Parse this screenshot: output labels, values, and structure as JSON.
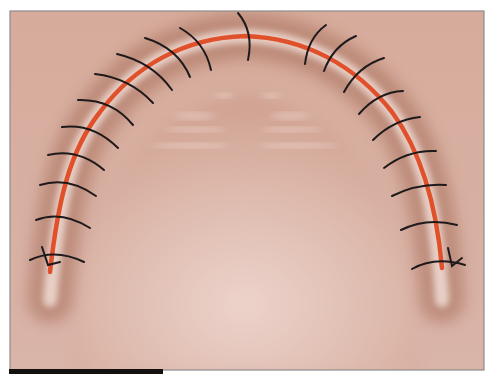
{
  "figure": {
    "colors": {
      "background": "#ffffff",
      "palate_light": "#e6c7bd",
      "palate_mid": "#d9afa1",
      "ridge_shadow": "#a86a55",
      "ridge_highlight": "#f1ddd6",
      "incision": "#e0502a",
      "suture": "#1e1a1c",
      "frame_border": "#8f8a8c",
      "bottom_bar": "#141010"
    },
    "frame": {
      "x": 10,
      "y": 11,
      "width": 474,
      "height": 359
    },
    "bottom_bar": {
      "x": 9,
      "y": 369,
      "width": 154,
      "height": 5
    },
    "incision_path": "M 50 272 C 58 200, 70 150, 100 112 C 135 65, 185 38, 245 36 C 305 38, 355 65, 392 112 C 420 150, 436 200, 442 268",
    "ridge_path": "M 50 300 C 58 200, 70 150, 100 112 C 135 65, 185 38, 245 36 C 305 38, 355 65, 392 112 C 420 150, 436 200, 442 300",
    "sutures": [
      {
        "d": "M 30 260 Q 55 248 84 262",
        "knot": true
      },
      {
        "d": "M 36 220 Q 62 210 90 228"
      },
      {
        "d": "M 40 185 Q 68 176 96 196"
      },
      {
        "d": "M 48 155 Q 78 148 104 170"
      },
      {
        "d": "M 62 127 Q 93 123 118 148"
      },
      {
        "d": "M 78 100 Q 112 99 133 125"
      },
      {
        "d": "M 95 74 Q 130 78 153 103"
      },
      {
        "d": "M 117 54 Q 152 62 172 90"
      },
      {
        "d": "M 145 38 Q 178 48 190 77"
      },
      {
        "d": "M 180 28 Q 205 42 211 70"
      },
      {
        "d": "M 238 13 Q 254 32 248 60"
      },
      {
        "d": "M 305 64 Q 308 38 326 25"
      },
      {
        "d": "M 324 71 Q 333 46 356 36"
      },
      {
        "d": "M 344 92 Q 358 66 384 58"
      },
      {
        "d": "M 359 114 Q 378 92 403 91"
      },
      {
        "d": "M 373 140 Q 393 120 420 117"
      },
      {
        "d": "M 384 168 Q 407 150 436 151"
      },
      {
        "d": "M 392 196 Q 418 183 446 185"
      },
      {
        "d": "M 401 230 Q 427 217 457 225"
      },
      {
        "d": "M 412 269 Q 435 256 465 265",
        "knot": true
      }
    ],
    "knots": [
      {
        "d": "M 42 247 L 48 265 L 60 262"
      },
      {
        "d": "M 448 248 L 452 266 L 462 258"
      }
    ],
    "rugae": [
      {
        "x": 175,
        "y": 113,
        "w": 40,
        "h": 6
      },
      {
        "x": 270,
        "y": 113,
        "w": 40,
        "h": 6
      },
      {
        "x": 165,
        "y": 127,
        "w": 60,
        "h": 5
      },
      {
        "x": 262,
        "y": 127,
        "w": 60,
        "h": 5
      },
      {
        "x": 150,
        "y": 143,
        "w": 80,
        "h": 5
      },
      {
        "x": 258,
        "y": 143,
        "w": 80,
        "h": 5
      },
      {
        "x": 215,
        "y": 93,
        "w": 18,
        "h": 5
      },
      {
        "x": 262,
        "y": 93,
        "w": 18,
        "h": 5
      }
    ]
  }
}
